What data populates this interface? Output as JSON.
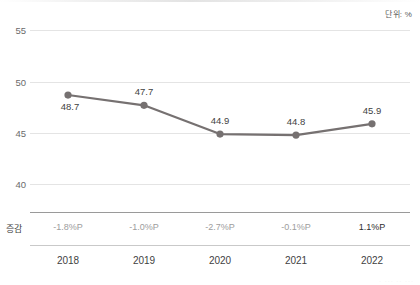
{
  "chart_data": {
    "type": "line",
    "title": "",
    "subtitle": "",
    "unit_caption": "단위: %",
    "xlabel": "",
    "ylabel": "",
    "categories": [
      "2018",
      "2019",
      "2020",
      "2021",
      "2022"
    ],
    "values": [
      48.7,
      47.7,
      44.9,
      44.8,
      45.9
    ],
    "point_labels": [
      "48.7",
      "47.7",
      "44.9",
      "44.8",
      "45.9"
    ],
    "ylim": [
      38,
      56
    ],
    "yticks": [
      55,
      50,
      45,
      40
    ],
    "ytick_labels": [
      "55",
      "50",
      "45",
      "40"
    ],
    "grid": true,
    "legend": "none",
    "series": [
      {
        "name": "",
        "values": [
          48.7,
          47.7,
          44.9,
          44.8,
          45.9
        ],
        "color": "#767171",
        "marker": "circle"
      }
    ],
    "change_row": {
      "label": "증감",
      "values": [
        "-1.8%P",
        "-1.0%P",
        "-2.7%P",
        "-0.1%P",
        "1.1%P"
      ],
      "signs": [
        "neg",
        "neg",
        "neg",
        "neg",
        "pos"
      ]
    },
    "colors": {
      "line": "#767171",
      "marker": "#767171",
      "gridline": "#e4e4e4",
      "axis_text": "#6b6b6b",
      "label_text": "#3f3f3f",
      "negative_text": "#9d9d9d",
      "positive_text": "#2e2e2e",
      "background": "#ffffff"
    }
  },
  "footer": {
    "ghost_text": "· ··· ·· ···"
  }
}
